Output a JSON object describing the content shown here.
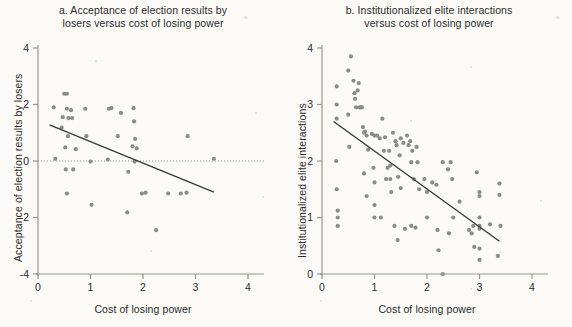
{
  "figure": {
    "background_color": "#fbfaf7",
    "point_color": "#8b8b8b",
    "line_color": "#3a3a3a",
    "axis_color": "#9a968d"
  },
  "panels": [
    {
      "id": "panel-a",
      "title_line1": "a. Acceptance of election results by",
      "title_line2": "losers versus cost of losing power",
      "ylabel": "Acceptance of election results by losers",
      "xlabel": "Cost of losing power",
      "xticks": [
        "0",
        "1",
        "2",
        "3",
        "4"
      ],
      "yticks": [
        "4",
        "2",
        "0",
        "-2",
        "-4"
      ]
    },
    {
      "id": "panel-b",
      "title_line1": "b. Institutionalized elite interactions",
      "title_line2": "versus cost of losing power",
      "ylabel": "Institutionalized elite interactions",
      "xlabel": "Cost of losing power",
      "xticks": [
        "0",
        "1",
        "2",
        "3",
        "4"
      ],
      "yticks": [
        "4",
        "3",
        "2",
        "1",
        "0"
      ]
    }
  ],
  "chart_data": [
    {
      "type": "scatter",
      "title": "a. Acceptance of election results by losers versus cost of losing power",
      "xlabel": "Cost of losing power",
      "ylabel": "Acceptance of election results by losers",
      "xlim": [
        0,
        4.4
      ],
      "ylim": [
        -4.4,
        4.4
      ],
      "xticks": [
        0,
        1,
        2,
        3,
        4
      ],
      "yticks": [
        -4,
        -2,
        0,
        2,
        4
      ],
      "grid": false,
      "legend": "none",
      "reference_line": {
        "type": "horizontal",
        "y": 0,
        "style": "dotted"
      },
      "fit_line": {
        "x": [
          0.22,
          3.35
        ],
        "y": [
          1.28,
          -1.1
        ],
        "style": "solid"
      },
      "points": [
        [
          0.3,
          1.9
        ],
        [
          0.33,
          0.08
        ],
        [
          0.45,
          1.18
        ],
        [
          0.47,
          1.55
        ],
        [
          0.5,
          2.38
        ],
        [
          0.55,
          2.38
        ],
        [
          0.52,
          0.48
        ],
        [
          0.53,
          -0.3
        ],
        [
          0.55,
          1.85
        ],
        [
          0.58,
          1.52
        ],
        [
          0.57,
          0.88
        ],
        [
          0.55,
          -1.15
        ],
        [
          0.63,
          1.8
        ],
        [
          0.65,
          1.52
        ],
        [
          0.67,
          -0.3
        ],
        [
          0.72,
          0.42
        ],
        [
          0.9,
          1.85
        ],
        [
          0.92,
          0.88
        ],
        [
          1.0,
          -0.02
        ],
        [
          1.02,
          -1.55
        ],
        [
          1.33,
          0.05
        ],
        [
          1.35,
          1.85
        ],
        [
          1.4,
          1.88
        ],
        [
          1.52,
          0.88
        ],
        [
          1.58,
          1.7
        ],
        [
          1.7,
          -1.82
        ],
        [
          1.72,
          -0.38
        ],
        [
          1.8,
          0.52
        ],
        [
          1.82,
          1.87
        ],
        [
          1.83,
          1.4
        ],
        [
          1.84,
          -0.02
        ],
        [
          1.85,
          0.78
        ],
        [
          1.88,
          0.45
        ],
        [
          1.98,
          -1.15
        ],
        [
          2.05,
          -1.12
        ],
        [
          2.25,
          -2.45
        ],
        [
          2.48,
          -1.15
        ],
        [
          2.72,
          -1.15
        ],
        [
          2.83,
          -1.12
        ],
        [
          2.85,
          0.88
        ],
        [
          3.35,
          0.08
        ]
      ]
    },
    {
      "type": "scatter",
      "title": "b. Institutionalized elite interactions versus cost of losing power",
      "xlabel": "Cost of losing power",
      "ylabel": "Institutionalized elite interactions",
      "xlim": [
        0,
        4.4
      ],
      "ylim": [
        -0.2,
        4.4
      ],
      "xticks": [
        0,
        1,
        2,
        3,
        4
      ],
      "yticks": [
        0,
        1,
        2,
        3,
        4
      ],
      "grid": false,
      "legend": "none",
      "fit_line": {
        "x": [
          0.22,
          3.38
        ],
        "y": [
          2.7,
          0.58
        ],
        "style": "solid"
      },
      "points": [
        [
          0.28,
          3.32
        ],
        [
          0.28,
          3.0
        ],
        [
          0.28,
          2.75
        ],
        [
          0.27,
          2.0
        ],
        [
          0.28,
          1.5
        ],
        [
          0.3,
          1.12
        ],
        [
          0.3,
          1.0
        ],
        [
          0.3,
          0.85
        ],
        [
          0.5,
          3.6
        ],
        [
          0.5,
          2.82
        ],
        [
          0.52,
          2.25
        ],
        [
          0.55,
          3.85
        ],
        [
          0.6,
          3.42
        ],
        [
          0.62,
          3.2
        ],
        [
          0.63,
          3.1
        ],
        [
          0.65,
          2.95
        ],
        [
          0.68,
          3.25
        ],
        [
          0.7,
          3.38
        ],
        [
          0.72,
          2.95
        ],
        [
          0.74,
          2.95
        ],
        [
          0.76,
          2.95
        ],
        [
          0.78,
          2.6
        ],
        [
          0.8,
          2.5
        ],
        [
          0.82,
          2.52
        ],
        [
          0.85,
          2.45
        ],
        [
          0.8,
          1.78
        ],
        [
          0.85,
          1.38
        ],
        [
          0.88,
          2.2
        ],
        [
          0.95,
          2.48
        ],
        [
          0.98,
          1.88
        ],
        [
          1.0,
          2.45
        ],
        [
          1.0,
          1.62
        ],
        [
          1.0,
          1.22
        ],
        [
          1.0,
          1.0
        ],
        [
          1.05,
          2.45
        ],
        [
          1.1,
          2.4
        ],
        [
          1.12,
          1.0
        ],
        [
          1.15,
          2.75
        ],
        [
          1.18,
          2.18
        ],
        [
          1.2,
          2.42
        ],
        [
          1.22,
          1.68
        ],
        [
          1.25,
          1.88
        ],
        [
          1.28,
          2.18
        ],
        [
          1.3,
          1.92
        ],
        [
          1.3,
          1.68
        ],
        [
          1.32,
          1.45
        ],
        [
          1.35,
          2.5
        ],
        [
          1.38,
          0.85
        ],
        [
          1.4,
          2.35
        ],
        [
          1.42,
          2.28
        ],
        [
          1.44,
          0.6
        ],
        [
          1.45,
          1.72
        ],
        [
          1.48,
          2.1
        ],
        [
          1.5,
          2.4
        ],
        [
          1.5,
          1.52
        ],
        [
          1.55,
          2.32
        ],
        [
          1.58,
          0.8
        ],
        [
          1.62,
          2.45
        ],
        [
          1.65,
          2.28
        ],
        [
          1.68,
          2.35
        ],
        [
          1.7,
          1.98
        ],
        [
          1.7,
          0.85
        ],
        [
          1.72,
          2.18
        ],
        [
          1.75,
          1.68
        ],
        [
          1.78,
          0.82
        ],
        [
          1.8,
          2.25
        ],
        [
          1.82,
          1.98
        ],
        [
          1.85,
          1.5
        ],
        [
          1.95,
          1.68
        ],
        [
          2.0,
          1.45
        ],
        [
          2.0,
          1.0
        ],
        [
          2.1,
          1.62
        ],
        [
          2.18,
          1.58
        ],
        [
          2.2,
          0.78
        ],
        [
          2.22,
          0.42
        ],
        [
          2.3,
          1.98
        ],
        [
          2.3,
          0.0
        ],
        [
          2.4,
          1.85
        ],
        [
          2.42,
          0.72
        ],
        [
          2.45,
          1.98
        ],
        [
          2.48,
          1.68
        ],
        [
          2.5,
          1.0
        ],
        [
          2.62,
          1.28
        ],
        [
          2.8,
          0.78
        ],
        [
          2.85,
          0.72
        ],
        [
          2.88,
          0.85
        ],
        [
          2.9,
          0.48
        ],
        [
          2.95,
          1.8
        ],
        [
          3.0,
          1.45
        ],
        [
          3.0,
          1.38
        ],
        [
          3.0,
          1.0
        ],
        [
          3.0,
          0.85
        ],
        [
          3.0,
          0.8
        ],
        [
          3.0,
          0.45
        ],
        [
          3.0,
          0.25
        ],
        [
          3.2,
          0.88
        ],
        [
          3.38,
          1.6
        ],
        [
          3.38,
          1.4
        ],
        [
          3.4,
          0.85
        ],
        [
          3.35,
          0.32
        ]
      ]
    }
  ]
}
